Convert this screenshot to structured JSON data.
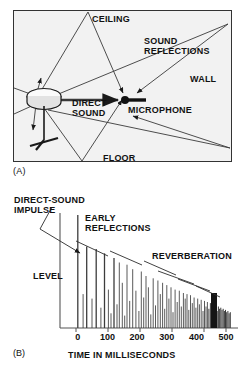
{
  "figure": {
    "panel_a": {
      "caption": "(A)",
      "labels": {
        "ceiling": "CEILING",
        "sound_reflections_line1": "SOUND",
        "sound_reflections_line2": "REFLECTIONS",
        "wall": "WALL",
        "direct_sound_line1": "DIRECT",
        "direct_sound_line2": "SOUND",
        "microphone": "MICROPHONE",
        "floor": "FLOOR"
      },
      "objects": {
        "loudspeaker": "loudspeaker-on-stand",
        "microphone": "microphone-capsule"
      }
    },
    "panel_b": {
      "caption": "(B)",
      "labels": {
        "direct_sound_impulse_line1": "DIRECT-SOUND",
        "direct_sound_impulse_line2": "IMPULSE",
        "early_reflections_line1": "EARLY",
        "early_reflections_line2": "REFLECTIONS",
        "reverberation": "REVERBERATION",
        "level": "LEVEL"
      }
    }
  },
  "chart_data": {
    "type": "bar",
    "title": "",
    "xlabel": "TIME IN MILLISECONDS",
    "ylabel": "LEVEL",
    "xlim": [
      -60,
      540
    ],
    "ylim": [
      0,
      100
    ],
    "grid": false,
    "legend": false,
    "xticks": [
      0,
      100,
      200,
      300,
      400,
      500
    ],
    "xtick_labels": [
      "0",
      "100",
      "200",
      "300",
      "400",
      "500"
    ],
    "annotations": [
      {
        "text": "DIRECT-SOUND IMPULSE",
        "points_to_x": 0,
        "points_to_y": 100
      },
      {
        "text": "EARLY REFLECTIONS",
        "span_x": [
          30,
          280
        ]
      },
      {
        "text": "REVERBERATION",
        "span_x": [
          280,
          515
        ]
      }
    ],
    "series": [
      {
        "name": "impulse response",
        "x": [
          0,
          18,
          30,
          48,
          62,
          78,
          90,
          103,
          112,
          122,
          132,
          140,
          150,
          158,
          166,
          175,
          185,
          196,
          206,
          214,
          222,
          230,
          238,
          246,
          254,
          262,
          270,
          278,
          286,
          293,
          300,
          307,
          314,
          321,
          328,
          335,
          342,
          349,
          356,
          362,
          368,
          374,
          380,
          386,
          392,
          398,
          404,
          410,
          416,
          422,
          427,
          432,
          437,
          442,
          447,
          452,
          457,
          462,
          466,
          470,
          474,
          478,
          482,
          486,
          490,
          494,
          498,
          502,
          506,
          510,
          514
        ],
        "values": [
          100,
          30,
          72,
          26,
          70,
          18,
          66,
          34,
          13,
          62,
          21,
          58,
          40,
          11,
          56,
          24,
          52,
          33,
          15,
          50,
          27,
          46,
          36,
          12,
          44,
          20,
          42,
          30,
          40,
          17,
          38,
          26,
          36,
          14,
          34,
          23,
          33,
          19,
          31,
          26,
          30,
          16,
          29,
          22,
          27,
          18,
          26,
          21,
          25,
          15,
          24,
          19,
          23,
          17,
          22,
          16,
          21,
          18,
          20,
          15,
          19,
          17,
          18,
          16,
          17,
          15,
          16,
          14,
          15,
          13,
          14
        ]
      }
    ],
    "envelope": {
      "description": "decaying upper envelope from direct impulse through early reflections into reverberation tail"
    }
  }
}
